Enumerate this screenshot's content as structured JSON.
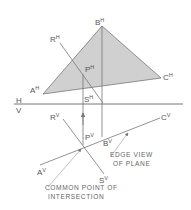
{
  "diagram": {
    "colors": {
      "plane_fill": "#d0d0d0",
      "line": "#777777",
      "text": "#555555",
      "background": "#ffffff"
    },
    "fold_line": {
      "top_label": "H",
      "bottom_label": "V"
    },
    "horizontal_view": {
      "points": {
        "A": {
          "base": "A",
          "sup": "H"
        },
        "B": {
          "base": "B",
          "sup": "H"
        },
        "C": {
          "base": "C",
          "sup": "H"
        },
        "R": {
          "base": "R",
          "sup": "H"
        },
        "S": {
          "base": "S",
          "sup": "H"
        },
        "P": {
          "base": "P",
          "sup": "H"
        }
      }
    },
    "vertical_view": {
      "points": {
        "A": {
          "base": "A",
          "sup": "V"
        },
        "B": {
          "base": "B",
          "sup": "V"
        },
        "C": {
          "base": "C",
          "sup": "V"
        },
        "R": {
          "base": "R",
          "sup": "V"
        },
        "S": {
          "base": "S",
          "sup": "V"
        },
        "P": {
          "base": "P",
          "sup": "V"
        }
      }
    },
    "annotations": {
      "edge_view_line1": "EDGE VIEW",
      "edge_view_line2": "OF PLANE",
      "common_point_line1": "COMMON POINT OF",
      "common_point_line2": "INTERSECTION"
    }
  }
}
